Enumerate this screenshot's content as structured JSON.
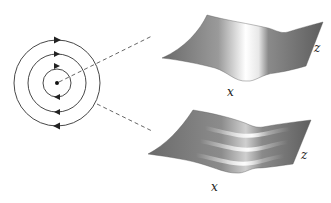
{
  "figure": {
    "left_panel": {
      "description": "concentric circular flow lines",
      "circle_count": 3,
      "arrow_direction_top": "right",
      "arrow_direction_bottom": "left",
      "center_marker": "dot"
    },
    "top_surface": {
      "description": "single ridge surface",
      "ridges": 1,
      "label_x": "x",
      "label_z": "z"
    },
    "bottom_surface": {
      "description": "multiple ridge surface",
      "ridges": 3,
      "label_x": "x",
      "label_z": "z"
    },
    "colors": {
      "stroke": "#333333",
      "surface_dark": "#6e6e6e",
      "surface_light": "#ffffff",
      "dash": "#555555"
    }
  }
}
